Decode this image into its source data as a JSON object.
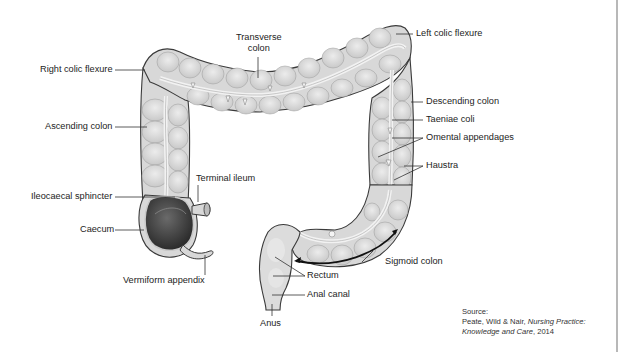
{
  "figure": {
    "colors": {
      "colon_fill": "#d9d9d9",
      "colon_outline": "#3a3a3a",
      "taenia": "#eeeeee",
      "caecum_interior": "#3d3d3d",
      "label_text": "#232323",
      "leader_line": "#333333",
      "right_border": "#b8b8b8"
    }
  },
  "labels": {
    "transverse_colon_1": "Transverse",
    "transverse_colon_2": "colon",
    "left_colic_flexure": "Left colic flexure",
    "right_colic_flexure": "Right colic flexure",
    "ascending_colon": "Ascending colon",
    "descending_colon": "Descending colon",
    "taeniae_coli": "Taeniae coli",
    "omental_appendages": "Omental appendages",
    "haustra": "Haustra",
    "terminal_ileum": "Terminal ileum",
    "ileocaecal_sphincter": "Ileocaecal sphincter",
    "caecum": "Caecum",
    "vermiform_appendix": "Vermiform appendix",
    "sigmoid_colon": "Sigmoid colon",
    "rectum": "Rectum",
    "anal_canal": "Anal canal",
    "anus": "Anus"
  },
  "source": {
    "heading": "Source:",
    "authors": "Peate, Wild & Nair, ",
    "title": "Nursing Practice:",
    "title_cont": "Knowledge and Care",
    "year": ", 2014"
  }
}
